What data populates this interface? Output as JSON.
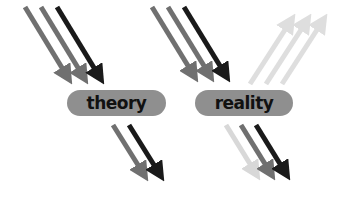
{
  "panels": [
    {
      "label": "theory",
      "incoming_arrows": [
        {
          "color": "#707070"
        },
        {
          "color": "#707070"
        },
        {
          "color": "#1a1a1a"
        }
      ],
      "outgoing_arrows": [
        {
          "color": "#707070"
        },
        {
          "color": "#1a1a1a"
        }
      ],
      "reflected_arrows": []
    },
    {
      "label": "reality",
      "incoming_arrows": [
        {
          "color": "#707070"
        },
        {
          "color": "#707070"
        },
        {
          "color": "#1a1a1a"
        }
      ],
      "outgoing_arrows": [
        {
          "color": "#d8d8d8"
        },
        {
          "color": "#707070"
        },
        {
          "color": "#1a1a1a"
        }
      ],
      "reflected_arrows": [
        {
          "color": "#dedede"
        },
        {
          "color": "#dedede"
        },
        {
          "color": "#dedede"
        }
      ]
    }
  ],
  "colors": {
    "pill": "#8f8f8f",
    "text": "#111111",
    "dark": "#1a1a1a",
    "mid": "#707070",
    "light": "#dedede"
  }
}
